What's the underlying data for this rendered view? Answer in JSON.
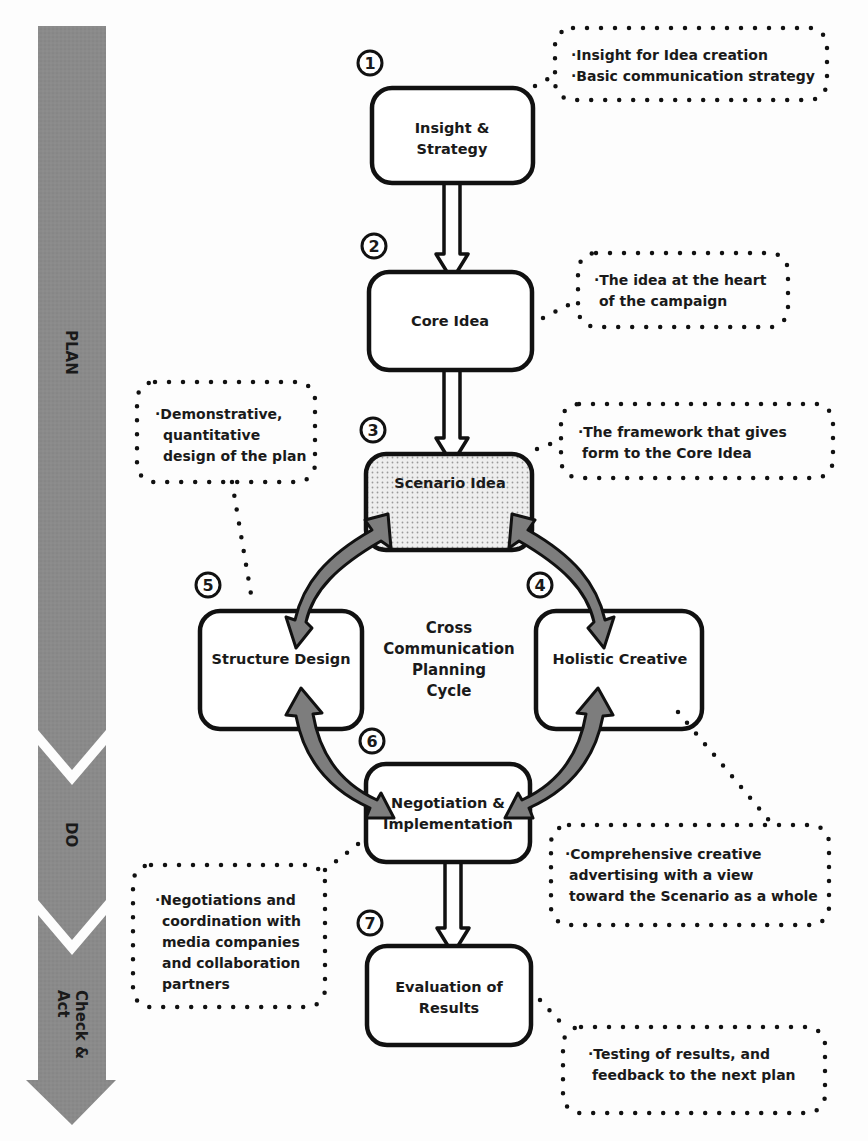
{
  "phases": [
    {
      "id": "plan",
      "label": "PLAN"
    },
    {
      "id": "do",
      "label": "DO"
    },
    {
      "id": "check_act",
      "label_line1": "Check &",
      "label_line2": "Act"
    }
  ],
  "steps": [
    {
      "number": "1",
      "line1": "Insight &",
      "line2": "Strategy"
    },
    {
      "number": "2",
      "line1": "Core Idea"
    },
    {
      "number": "3",
      "line1": "Scenario Idea"
    },
    {
      "number": "4",
      "line1": "Holistic Creative"
    },
    {
      "number": "5",
      "line1": "Structure Design"
    },
    {
      "number": "6",
      "line1": "Negotiation &",
      "line2": "Implementation"
    },
    {
      "number": "7",
      "line1": "Evaluation of",
      "line2": "Results"
    }
  ],
  "center_label": {
    "line1": "Cross",
    "line2": "Communication",
    "line3": "Planning",
    "line4": "Cycle"
  },
  "notes": {
    "insight": {
      "lines": [
        "·Insight for Idea creation",
        "·Basic communication strategy"
      ]
    },
    "core_idea": {
      "lines": [
        "·The idea at the heart",
        "of the campaign"
      ]
    },
    "scenario": {
      "lines": [
        "·The framework that gives",
        "form to the Core Idea"
      ]
    },
    "structure": {
      "lines": [
        "·Demonstrative,",
        "quantitative",
        "design of the plan"
      ]
    },
    "holistic": {
      "lines": [
        "·Comprehensive creative",
        "advertising with a view",
        "toward the Scenario as a whole"
      ]
    },
    "negotiation": {
      "lines": [
        "·Negotiations and",
        "coordination with",
        "media companies",
        "and collaboration",
        "partners"
      ]
    },
    "evaluation": {
      "lines": [
        "·Testing of results, and",
        "feedback to the next plan"
      ]
    }
  },
  "colors": {
    "phase_band": "#8a8a8a",
    "cycle_arrow_fill": "#7d7d7d",
    "outline": "#111111",
    "scenario_fill": "#e4e4e4",
    "background": "#fdfdfd"
  }
}
